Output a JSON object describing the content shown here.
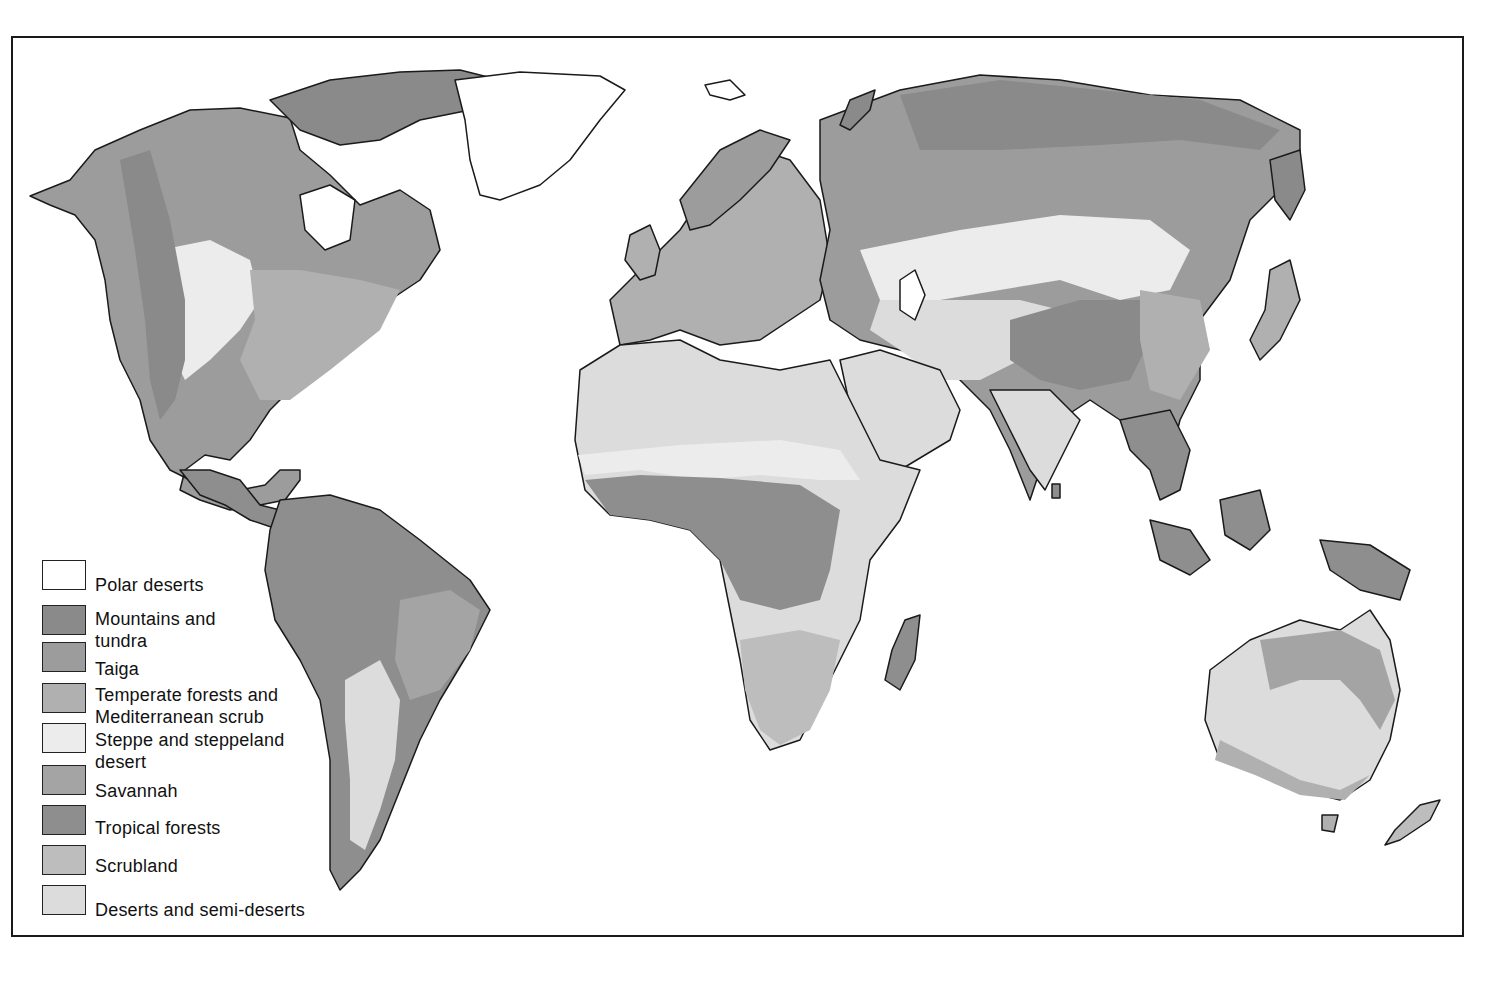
{
  "map": {
    "title": "World vegetation / biome zones",
    "palette": {
      "polar_deserts": "#ffffff",
      "mountains_tundra": "#8a8a8a",
      "taiga": "#9c9c9c",
      "temperate_forests": "#b0b0b0",
      "steppe": "#ececec",
      "savannah": "#a4a4a4",
      "tropical_forests": "#8e8e8e",
      "scrubland": "#bdbdbd",
      "deserts": "#dcdcdc",
      "outline": "#1a1a1a"
    }
  },
  "legend": {
    "items": [
      {
        "label_1": "Polar deserts",
        "label_2": "",
        "color": "#ffffff"
      },
      {
        "label_1": "Mountains and",
        "label_2": "tundra",
        "color": "#8a8a8a"
      },
      {
        "label_1": "Taiga",
        "label_2": "",
        "color": "#9c9c9c"
      },
      {
        "label_1": "Temperate forests and",
        "label_2": "Mediterranean scrub",
        "color": "#b0b0b0"
      },
      {
        "label_1": "Steppe and steppeland",
        "label_2": "desert",
        "color": "#ececec"
      },
      {
        "label_1": "Savannah",
        "label_2": "",
        "color": "#a4a4a4"
      },
      {
        "label_1": "Tropical forests",
        "label_2": "",
        "color": "#8e8e8e"
      },
      {
        "label_1": "Scrubland",
        "label_2": "",
        "color": "#bdbdbd"
      },
      {
        "label_1": "Deserts and semi-deserts",
        "label_2": "",
        "color": "#dcdcdc"
      }
    ]
  }
}
